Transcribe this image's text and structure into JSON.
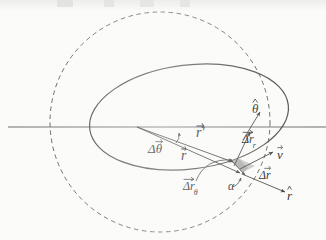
{
  "figure": {
    "width": 326,
    "height": 240
  },
  "colors": {
    "ink": "#1b1b1b",
    "curve": "#4a4a4a",
    "axis": "#6b6b6b",
    "dashed": "#5a5a5a",
    "swept_area_fill": "#9a9a9a",
    "background": "#fbfbfa"
  },
  "labels": {
    "r_prime": {
      "text": "r",
      "prime": "′",
      "accent": "vector",
      "name": "position-vector-r-prime"
    },
    "r": {
      "text": "r",
      "accent": "vector",
      "name": "position-vector-r"
    },
    "delta_theta": {
      "text": "Δθ",
      "accent": "vector",
      "name": "swept-angle-delta-theta"
    },
    "theta_hat": {
      "text": "θ",
      "accent": "hat",
      "name": "unit-vector-theta-hat"
    },
    "delta_r_radial": {
      "text": "Δr",
      "subscript": "r",
      "accent": "vector",
      "name": "radial-component-delta-r-r"
    },
    "delta_r_tangential": {
      "text": "Δr",
      "subscript": "θ",
      "accent": "vector",
      "name": "tangential-component-delta-r-theta"
    },
    "delta_r": {
      "text": "Δr",
      "accent": "vector",
      "name": "displacement-vector-delta-r"
    },
    "v": {
      "text": "v",
      "accent": "vector",
      "name": "velocity-vector-v"
    },
    "r_hat": {
      "text": "r",
      "accent": "hat",
      "name": "unit-vector-r-hat"
    },
    "alpha": {
      "text": "α",
      "accent": "none",
      "name": "angle-alpha"
    }
  },
  "geometry": {
    "focus_point": {
      "x": 137,
      "y": 127
    },
    "body_point": {
      "x": 237,
      "y": 167
    },
    "ellipse": {
      "cx": 189,
      "cy": 117,
      "rx": 100,
      "ry": 52,
      "rotation_deg": -7
    },
    "dashed_circle": {
      "cx": 160,
      "cy": 122,
      "r": 110
    },
    "axis_line": {
      "x1": 8,
      "y1": 127,
      "x2": 326,
      "y2": 127
    }
  },
  "vectors": [
    {
      "name": "r-prime",
      "from": [
        137,
        127
      ],
      "to": [
        232,
        161
      ],
      "style": "solid-arrow"
    },
    {
      "name": "r",
      "from": [
        137,
        127
      ],
      "to": [
        238,
        172
      ],
      "style": "solid-arrow"
    },
    {
      "name": "delta-r",
      "from": [
        232,
        161
      ],
      "to": [
        243,
        173
      ],
      "style": "solid-arrow"
    },
    {
      "name": "delta-r-radial",
      "from": [
        233,
        165
      ],
      "to": [
        249,
        133
      ],
      "style": "solid-arrow"
    },
    {
      "name": "velocity",
      "from": [
        239,
        168
      ],
      "to": [
        272,
        152
      ],
      "style": "solid-arrow"
    },
    {
      "name": "theta-hat",
      "from": [
        244,
        138
      ],
      "to": [
        259,
        113
      ],
      "style": "solid-arrow"
    },
    {
      "name": "r-hat",
      "from": [
        243,
        174
      ],
      "to": [
        283,
        191
      ],
      "style": "solid-arrow"
    }
  ],
  "arcs": [
    {
      "name": "delta-theta-arc",
      "about": "between r and r-prime near the focus"
    },
    {
      "name": "alpha-arc",
      "about": "between delta-r and r-hat at the body"
    },
    {
      "name": "delta-r-theta-arc",
      "about": "tangential component arc below the body"
    }
  ],
  "top_scan_artifacts": [
    {
      "left": 57,
      "width": 16
    },
    {
      "left": 104,
      "width": 10
    },
    {
      "left": 140,
      "width": 14
    },
    {
      "left": 180,
      "width": 10
    }
  ]
}
